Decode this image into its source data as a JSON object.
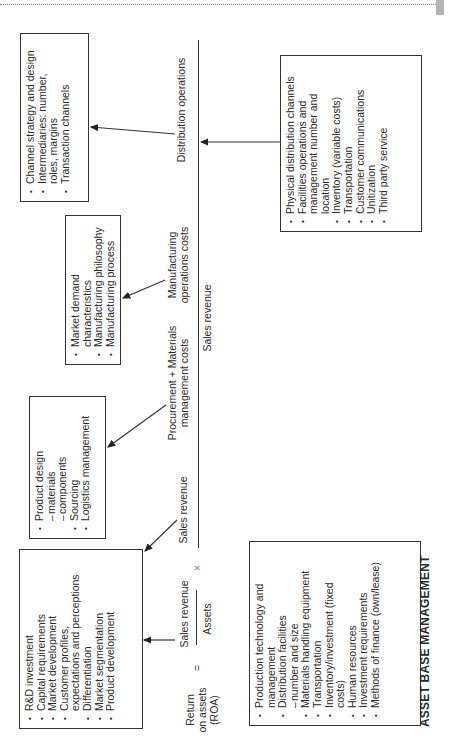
{
  "formula": {
    "left_label_lines": [
      "Return",
      "on assets",
      "(ROA)"
    ],
    "equals": "=",
    "numerator": "Sales revenue",
    "denominator": "Assets",
    "times": "×"
  },
  "axis": {
    "above_labels": [
      {
        "text": "Sales revenue"
      },
      {
        "text_lines": [
          "Procurement + Materials",
          "management costs"
        ]
      },
      {
        "text_lines": [
          "Manufacturing",
          "operations costs"
        ]
      },
      {
        "text": "Distribution operations"
      }
    ],
    "below_label": "Sales revenue"
  },
  "boxes": {
    "marketing": {
      "items": [
        {
          "type": "bullet",
          "text": "R&D investment"
        },
        {
          "type": "bullet",
          "text": "Capital requirements"
        },
        {
          "type": "bullet",
          "text": "Market development"
        },
        {
          "type": "bullet",
          "text": "Customer profiles,"
        },
        {
          "type": "cont",
          "text": "expectations and perceptions"
        },
        {
          "type": "bullet",
          "text": "Differentiation"
        },
        {
          "type": "bullet",
          "text": "Market segmentation"
        },
        {
          "type": "bullet",
          "text": "Product development"
        }
      ]
    },
    "procurement": {
      "items": [
        {
          "type": "bullet",
          "text": "Product design"
        },
        {
          "type": "sub",
          "text": "materials"
        },
        {
          "type": "sub",
          "text": "components"
        },
        {
          "type": "bullet",
          "text": "Sourcing"
        },
        {
          "type": "bullet",
          "text": "Logistics management"
        }
      ]
    },
    "manufacturing": {
      "items": [
        {
          "type": "bullet",
          "text": "Market demand"
        },
        {
          "type": "cont",
          "text": "characteristics"
        },
        {
          "type": "bullet",
          "text": "Manufacturing philosophy"
        },
        {
          "type": "bullet",
          "text": "Manufacturing process"
        }
      ]
    },
    "channel": {
      "items": [
        {
          "type": "bullet",
          "text": "Channel strategy and design"
        },
        {
          "type": "bullet",
          "text": "Intermediaries: number,"
        },
        {
          "type": "cont",
          "text": "roles, margins"
        },
        {
          "type": "bullet",
          "text": "Transaction channels"
        }
      ]
    },
    "physical_distribution": {
      "items": [
        {
          "type": "bullet",
          "text": "Physical distribution channels"
        },
        {
          "type": "bullet",
          "text": "Facilities operations and"
        },
        {
          "type": "cont",
          "text": "management number and"
        },
        {
          "type": "cont",
          "text": "location"
        },
        {
          "type": "bullet",
          "text": "Inventory (variable costs)"
        },
        {
          "type": "bullet",
          "text": "Transportation"
        },
        {
          "type": "bullet",
          "text": "Customer communications"
        },
        {
          "type": "bullet",
          "text": "Unitization"
        },
        {
          "type": "bullet",
          "text": "Third party service"
        }
      ]
    },
    "asset_base": {
      "items": [
        {
          "type": "bullet",
          "text": "Production technology and"
        },
        {
          "type": "cont",
          "text": "management"
        },
        {
          "type": "bullet",
          "text": "Distribution facilities"
        },
        {
          "type": "sub",
          "text": "number and size"
        },
        {
          "type": "bullet",
          "text": "Materials handling equipment"
        },
        {
          "type": "bullet",
          "text": "Transportation"
        },
        {
          "type": "bullet",
          "text": "Inventory/investment (fixed"
        },
        {
          "type": "cont",
          "text": "costs)"
        },
        {
          "type": "bullet",
          "text": "Human resources"
        },
        {
          "type": "bullet",
          "text": "Investment requirements"
        },
        {
          "type": "bullet",
          "text": "Methods of finance (own/lease)"
        }
      ]
    }
  },
  "section_title": "ASSET BASE MANAGEMENT",
  "colors": {
    "ink": "#2a2a2a",
    "border": "#333333",
    "page_tab": "#b5b5b5",
    "background": "#ffffff"
  }
}
